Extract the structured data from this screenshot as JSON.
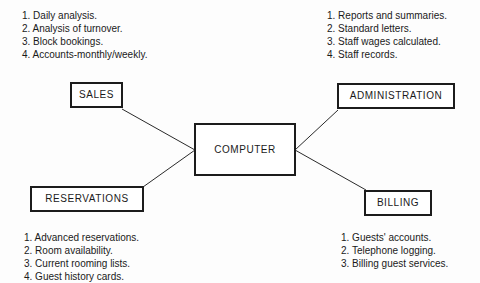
{
  "diagram": {
    "background_color": "#fdfdfd",
    "line_color": "#1c1c1c",
    "text_color": "#1a1a1a"
  },
  "nodes": {
    "computer": {
      "label": "COMPUTER"
    },
    "sales": {
      "label": "SALES"
    },
    "administration": {
      "label": "ADMINISTRATION"
    },
    "reservations": {
      "label": "RESERVATIONS"
    },
    "billing": {
      "label": "BILLING"
    }
  },
  "notes": {
    "sales": {
      "lines": [
        "1. Daily analysis.",
        "2. Analysis of turnover.",
        "3. Block bookings.",
        "4. Accounts-monthly/weekly."
      ]
    },
    "administration": {
      "lines": [
        "1. Reports and summaries.",
        "2. Standard letters.",
        "3. Staff wages calculated.",
        "4. Staff records."
      ]
    },
    "reservations": {
      "lines": [
        "1. Advanced reservations.",
        "2. Room availability.",
        "3. Current rooming lists.",
        "4. Guest history cards."
      ]
    },
    "billing": {
      "lines": [
        "1. Guests' accounts.",
        "2. Telephone logging.",
        "3. Billing guest services."
      ]
    }
  },
  "connections": [
    {
      "from": "sales",
      "to": "computer"
    },
    {
      "from": "reservations",
      "to": "computer"
    },
    {
      "from": "administration",
      "to": "computer"
    },
    {
      "from": "billing",
      "to": "computer"
    }
  ]
}
